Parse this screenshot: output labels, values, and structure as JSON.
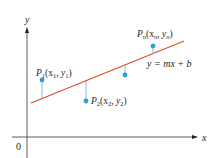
{
  "diagram": {
    "axes": {
      "x_label": "x",
      "y_label": "y",
      "origin_label": "0"
    },
    "line": {
      "equation_label": "y = mx + b",
      "color": "#e0502a",
      "start": [
        31,
        103
      ],
      "end": [
        184,
        41
      ]
    },
    "points": [
      {
        "name": "P1",
        "label_main": "P",
        "label_sub": "1",
        "label_rest": "(x",
        "label_sub2": "1",
        "label_mid": ", y",
        "label_sub3": "1",
        "label_end": ")",
        "x": 42,
        "y": 80,
        "line_y": 98
      },
      {
        "name": "P2",
        "label_main": "P",
        "label_sub": "2",
        "label_rest": "(x",
        "label_sub2": "2",
        "label_mid": ", y",
        "label_sub3": "2",
        "label_end": ")",
        "x": 86,
        "y": 101,
        "line_y": 81
      },
      {
        "name": "P3",
        "x": 125,
        "y": 75,
        "line_y": 65
      },
      {
        "name": "Pn",
        "label_main": "P",
        "label_sub": "n",
        "label_rest": "(x",
        "label_sub2": "n",
        "label_mid": ", y",
        "label_sub3": "n",
        "label_end": ")",
        "x": 153,
        "y": 46,
        "line_y": 54
      }
    ],
    "colors": {
      "point": "#2a9fd6",
      "residual": "#6bb8df",
      "axis": "#231f20"
    }
  }
}
